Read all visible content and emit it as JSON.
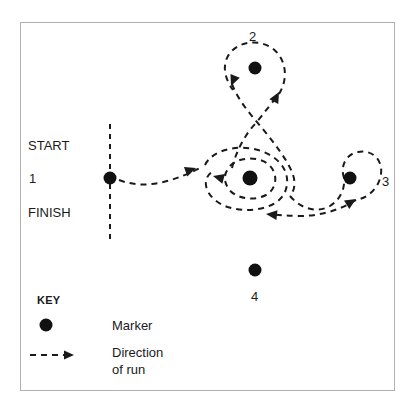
{
  "figure": {
    "frame_color": "#b0b0b0",
    "ink_color": "#1a1a1a"
  },
  "labels": {
    "start": "START",
    "start_number": "1",
    "finish": "FINISH",
    "marker_2": "2",
    "marker_3": "3",
    "marker_4": "4"
  },
  "key": {
    "heading": "KEY",
    "marker_label": "Marker",
    "direction_label_line1": "Direction",
    "direction_label_line2": "of run"
  },
  "markers": [
    {
      "name": "marker-start-1",
      "label": "1",
      "cx": 110,
      "cy": 178,
      "r": 6.5
    },
    {
      "name": "marker-2",
      "label": "2",
      "cx": 255,
      "cy": 68,
      "r": 6.5
    },
    {
      "name": "marker-center",
      "label": "",
      "cx": 250,
      "cy": 178,
      "r": 7.5
    },
    {
      "name": "marker-3",
      "label": "3",
      "cx": 350,
      "cy": 178,
      "r": 6.5
    },
    {
      "name": "marker-4",
      "label": "4",
      "cx": 255,
      "cy": 270,
      "r": 6.5
    },
    {
      "name": "key-marker-swatch",
      "label": "",
      "cx": 46,
      "cy": 325,
      "r": 6.5
    }
  ],
  "start_finish_line": {
    "name": "start-finish-line",
    "x": 110,
    "y_top": 124,
    "y_bottom": 242,
    "style": "dashed"
  },
  "route": {
    "style": "dashed",
    "arrowheads": [
      {
        "name": "arrow-leg1",
        "x": 192,
        "y": 170,
        "angle": -12
      },
      {
        "name": "arrow-center-loop",
        "x": 217,
        "y": 176,
        "angle": 200
      },
      {
        "name": "arrow-up-to-2",
        "x": 277,
        "y": 93,
        "angle": -62
      },
      {
        "name": "arrow-loop-2",
        "x": 232,
        "y": 78,
        "angle": 118
      },
      {
        "name": "arrow-return-left",
        "x": 266,
        "y": 214,
        "angle": 190
      },
      {
        "name": "arrow-into-3",
        "x": 351,
        "y": 200,
        "angle": -28
      }
    ]
  }
}
